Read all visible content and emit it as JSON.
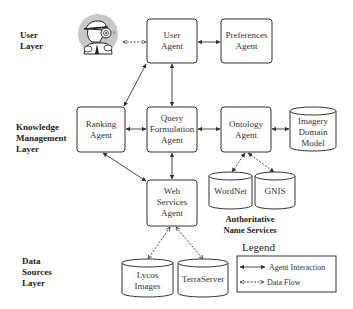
{
  "layers": [
    {
      "id": "user",
      "lines": [
        "User",
        "Layer"
      ]
    },
    {
      "id": "knowledge",
      "lines": [
        "Knowledge",
        "Management",
        "Layer"
      ]
    },
    {
      "id": "data",
      "lines": [
        "Data",
        "Sources",
        "Layer"
      ]
    }
  ],
  "nodes": {
    "user_icon": {
      "icon": "detective-icon"
    },
    "user_agent": {
      "lines": [
        "User",
        "Agent"
      ]
    },
    "preferences_agent": {
      "lines": [
        "Preferences",
        "Agent"
      ]
    },
    "ranking_agent": {
      "lines": [
        "Ranking",
        "Agent"
      ]
    },
    "query_agent": {
      "lines": [
        "Query",
        "Formulation",
        "Agent"
      ]
    },
    "ontology_agent": {
      "lines": [
        "Ontology",
        "Agent"
      ]
    },
    "imagery_model": {
      "lines": [
        "Imagery",
        "Domain",
        "Model"
      ]
    },
    "wordnet": {
      "lines": [
        "WordNet"
      ]
    },
    "gnis": {
      "lines": [
        "GNIS"
      ]
    },
    "web_services_agent": {
      "lines": [
        "Web",
        "Services",
        "Agent"
      ]
    },
    "lycos": {
      "lines": [
        "Lycos",
        "Images"
      ]
    },
    "terraserver": {
      "lines": [
        "TerraServer"
      ]
    }
  },
  "groups": {
    "name_services": {
      "lines": [
        "Authoritative",
        "Name Services"
      ]
    }
  },
  "legend": {
    "title": "Legend",
    "items": [
      {
        "style": "solid",
        "label": "Agent Interaction"
      },
      {
        "style": "dashed",
        "label": "Data Flow"
      }
    ]
  },
  "edges": [
    {
      "from": "user_icon",
      "to": "user_agent",
      "type": "data-flow"
    },
    {
      "from": "user_agent",
      "to": "preferences_agent",
      "type": "agent-interaction"
    },
    {
      "from": "user_agent",
      "to": "query_agent",
      "type": "agent-interaction"
    },
    {
      "from": "user_agent",
      "to": "ranking_agent",
      "type": "agent-interaction"
    },
    {
      "from": "ranking_agent",
      "to": "query_agent",
      "type": "agent-interaction"
    },
    {
      "from": "query_agent",
      "to": "ontology_agent",
      "type": "agent-interaction"
    },
    {
      "from": "ontology_agent",
      "to": "imagery_model",
      "type": "agent-interaction"
    },
    {
      "from": "ontology_agent",
      "to": "wordnet",
      "type": "data-flow"
    },
    {
      "from": "ontology_agent",
      "to": "gnis",
      "type": "data-flow"
    },
    {
      "from": "query_agent",
      "to": "web_services_agent",
      "type": "agent-interaction"
    },
    {
      "from": "web_services_agent",
      "to": "ranking_agent",
      "type": "agent-interaction"
    },
    {
      "from": "web_services_agent",
      "to": "lycos",
      "type": "data-flow"
    },
    {
      "from": "web_services_agent",
      "to": "terraserver",
      "type": "data-flow"
    }
  ],
  "colors": {
    "stroke": "#333333",
    "icon_bg": "#c8c8c8"
  }
}
